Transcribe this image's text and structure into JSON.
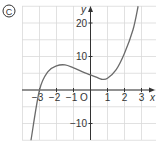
{
  "panel_label": "C",
  "chart_data": {
    "type": "line",
    "title": "",
    "xlabel": "x",
    "ylabel": "y",
    "origin_label": "O",
    "x_ticks": [
      "-3",
      "-2",
      "-1",
      "1",
      "2",
      "3"
    ],
    "y_ticks": [
      "20",
      "10",
      "-10"
    ],
    "xlim": [
      -4,
      4
    ],
    "ylim": [
      -15,
      27
    ],
    "grid": true,
    "series": [
      {
        "name": "cubic curve",
        "x": [
          -3.5,
          -3.0,
          -2.5,
          -2.0,
          -1.5,
          -1.0,
          -0.5,
          0.0,
          0.5,
          0.7,
          1.0,
          1.5,
          2.0,
          2.5,
          2.8
        ],
        "y": [
          -15,
          0,
          5.5,
          7.2,
          7.5,
          6.6,
          5.5,
          4.5,
          3.5,
          3.2,
          3.5,
          6.0,
          11.0,
          18.0,
          25.0
        ]
      }
    ],
    "colors": {
      "curve": "#6b6b6b",
      "grid": "#d9d9d9",
      "axes": "#333333"
    }
  }
}
